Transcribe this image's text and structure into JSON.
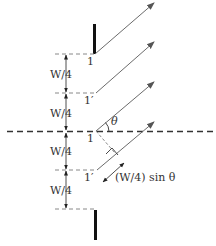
{
  "diagram": {
    "type": "two-slit-array-geometry",
    "labels": {
      "point_top": "1",
      "point_top_prime": "1′",
      "point_center": "1",
      "point_center_prime": "1′",
      "spacing_1": "W/4",
      "spacing_2": "W/4",
      "spacing_3": "W/4",
      "spacing_4": "W/4",
      "angle": "θ",
      "path_difference": "(W/4) sin θ"
    },
    "colors": {
      "ray": "#6b6b6b",
      "barrier": "#111111",
      "dashed": "#888888",
      "axis": "#333333",
      "text": "#333333"
    }
  }
}
